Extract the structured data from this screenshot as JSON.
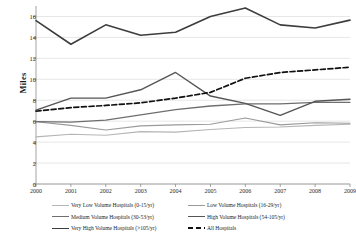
{
  "chart_data": {
    "type": "line",
    "title": "",
    "xlabel": "",
    "ylabel": "Miles",
    "x": [
      2000,
      2001,
      2002,
      2003,
      2004,
      2005,
      2006,
      2007,
      2008,
      2009
    ],
    "xtick_labels": [
      "2000",
      "2001",
      "2002",
      "2003",
      "2004",
      "2005",
      "2006",
      "2007",
      "2008",
      "2009"
    ],
    "ytick_labels": [
      "0",
      "2",
      "4",
      "6",
      "8",
      "10",
      "12",
      "14",
      "16"
    ],
    "yticks": [
      0,
      2,
      4,
      6,
      8,
      10,
      12,
      14,
      16
    ],
    "ylim": [
      0,
      17
    ],
    "grid": true,
    "legend_position": "bottom",
    "series": [
      {
        "name": "Very Low Volume Hospitals (0-15/yr)",
        "color": "#b5b5b5",
        "width": 1.1,
        "dash": "none",
        "values": [
          4.5,
          4.75,
          4.65,
          5.0,
          4.95,
          5.2,
          5.4,
          5.45,
          5.6,
          5.7
        ]
      },
      {
        "name": "Low Volume Hospitals (16-29/yr)",
        "color": "#9a9a9a",
        "width": 1.1,
        "dash": "none",
        "values": [
          5.95,
          5.6,
          5.15,
          5.55,
          5.65,
          5.7,
          6.3,
          5.65,
          5.85,
          5.8
        ]
      },
      {
        "name": "Medium Volume Hospitals (30-53/yr)",
        "color": "#6e6e6e",
        "width": 1.3,
        "dash": "none",
        "values": [
          5.95,
          5.9,
          6.1,
          6.6,
          7.1,
          7.45,
          7.65,
          7.65,
          7.8,
          7.8
        ]
      },
      {
        "name": "High Volume Hospitals (54-105/yr)",
        "color": "#555555",
        "width": 1.4,
        "dash": "none",
        "values": [
          7.05,
          8.2,
          8.2,
          9.0,
          10.65,
          8.4,
          7.7,
          6.55,
          7.9,
          8.1
        ]
      },
      {
        "name": "Very High Volume Hospitals (>105/yr)",
        "color": "#3d3d3d",
        "width": 1.6,
        "dash": "none",
        "values": [
          15.6,
          13.35,
          15.2,
          14.2,
          14.5,
          16.0,
          16.8,
          15.2,
          14.9,
          15.65
        ]
      },
      {
        "name": "All Hospitals",
        "color": "#111111",
        "width": 1.7,
        "dash": "dashed",
        "values": [
          6.95,
          7.3,
          7.5,
          7.75,
          8.2,
          8.75,
          10.1,
          10.65,
          10.9,
          11.15
        ]
      }
    ]
  },
  "legend": {
    "entries": [
      {
        "label": "Very Low Volume Hospitals (0-15/yr)",
        "series": 0
      },
      {
        "label": "Low Volume Hospitals (16-29/yr)",
        "series": 1
      },
      {
        "label": "Medium Volume Hospitals (30-53/yr)",
        "series": 2
      },
      {
        "label": "High Volume Hospitals (54-105/yr)",
        "series": 3
      },
      {
        "label": "Very High Volume Hospitals (>105/yr)",
        "series": 4
      },
      {
        "label": "All Hospitals",
        "series": 5
      }
    ]
  },
  "axis": {
    "y_title": "Miles",
    "gridline_color": "#dcdcdc",
    "axis_color": "#8d8d8d"
  }
}
